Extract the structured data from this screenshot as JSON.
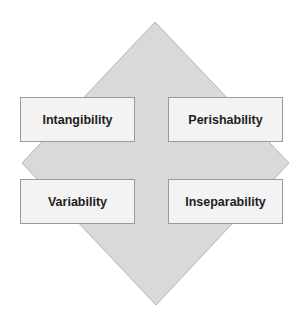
{
  "diagram": {
    "shape": "diamond",
    "colors": {
      "diamond_fill": "#d9d9d9",
      "diamond_stroke": "#b5b5b5",
      "box_fill": "#f3f3f3",
      "box_border": "#9a9a9a",
      "text": "#1e1e1e"
    },
    "boxes": [
      {
        "label": "Intangibility",
        "position": "top-left"
      },
      {
        "label": "Perishability",
        "position": "top-right"
      },
      {
        "label": "Variability",
        "position": "bottom-left"
      },
      {
        "label": "Inseparability",
        "position": "bottom-right"
      }
    ]
  }
}
